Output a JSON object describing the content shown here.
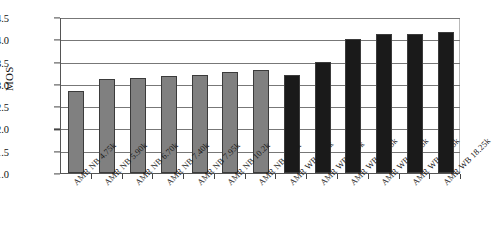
{
  "chart_data": {
    "type": "bar",
    "title": "",
    "xlabel": "",
    "ylabel": "MOS",
    "ylim": [
      1.0,
      4.5
    ],
    "ytick_labels": [
      "4.5",
      "4.0",
      "3.5",
      "3.0",
      "2.5",
      "2.0",
      "1.5",
      "1.0"
    ],
    "ytick_values": [
      4.5,
      4.0,
      3.5,
      3.0,
      2.5,
      2.0,
      1.5,
      1.0
    ],
    "grid": "horizontal",
    "legend": "none",
    "categories": [
      "AMR NB 4.75k",
      "AMR NB 5.90k",
      "AMR NB 6.70k",
      "AMR NB 7.40k",
      "AMR NB 7.95k",
      "AMR NB 10.2k",
      "AMR NB 12.2k",
      "AMR WB 6.60k",
      "AMR WB 8.85k",
      "AMR WB 12.65k",
      "AMR WB 14.25k",
      "AMR WB 15.85k",
      "AMR WB 18.25k"
    ],
    "values": [
      2.83,
      3.11,
      3.13,
      3.17,
      3.21,
      3.26,
      3.32,
      3.21,
      3.5,
      4.0,
      4.11,
      4.11,
      4.16
    ],
    "bar_colors": [
      "#808080",
      "#808080",
      "#808080",
      "#808080",
      "#808080",
      "#808080",
      "#808080",
      "#1a1a1a",
      "#1a1a1a",
      "#1a1a1a",
      "#1a1a1a",
      "#1a1a1a",
      "#1a1a1a"
    ],
    "series_groups": [
      {
        "name": "AMR NB",
        "color": "#808080",
        "count": 7
      },
      {
        "name": "AMR WB",
        "color": "#1a1a1a",
        "count": 6
      }
    ]
  },
  "caption": {
    "text": ""
  }
}
